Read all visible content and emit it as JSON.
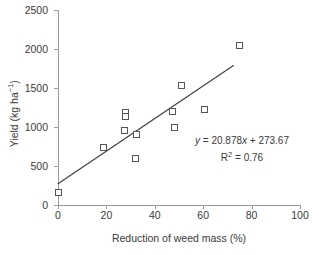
{
  "chart_data": {
    "type": "scatter",
    "title": "",
    "xlabel": "Reduction of weed mass (%)",
    "ylabel": "Yield (kg ha",
    "ylabel_sup": "−1",
    "ylabel_tail": ")",
    "xlim": [
      0,
      100
    ],
    "ylim": [
      0,
      2500
    ],
    "xticks": [
      0,
      20,
      40,
      60,
      80,
      100
    ],
    "yticks": [
      0,
      500,
      1000,
      1500,
      2000,
      2500
    ],
    "grid": false,
    "legend": "none",
    "points": [
      {
        "x": 0.0,
        "y": 160
      },
      {
        "x": 19.0,
        "y": 735
      },
      {
        "x": 27.5,
        "y": 960
      },
      {
        "x": 28.0,
        "y": 1185
      },
      {
        "x": 28.0,
        "y": 1130
      },
      {
        "x": 32.5,
        "y": 910
      },
      {
        "x": 32.0,
        "y": 590
      },
      {
        "x": 47.5,
        "y": 1200
      },
      {
        "x": 48.0,
        "y": 1000
      },
      {
        "x": 51.0,
        "y": 1530
      },
      {
        "x": 60.5,
        "y": 1230
      },
      {
        "x": 75.0,
        "y": 2050
      }
    ],
    "trendline": {
      "slope": 20.878,
      "intercept": 273.67,
      "x_start": 0.0,
      "x_end": 72.5,
      "y_start": 273.67,
      "y_end": 1787.3
    },
    "annotation": {
      "equation_prefix": "y",
      "equation_body": " = 20.878",
      "equation_x": "x",
      "equation_suffix": " + 273.67",
      "r2_label": "R",
      "r2_sup": "2",
      "r2_value": " = 0.76"
    }
  },
  "colors": {
    "marker_stroke": "#555555",
    "marker_fill": "#ffffff",
    "trendline": "#404040",
    "axis": "#9a9a9a",
    "text": "#3a3a3a",
    "background": "#ffffff"
  }
}
